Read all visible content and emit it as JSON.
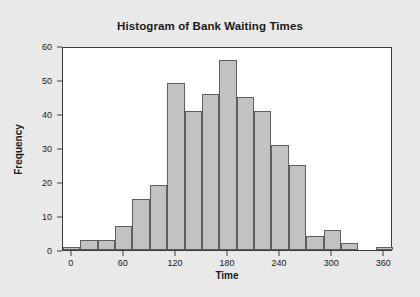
{
  "chart_data": {
    "type": "bar",
    "title": "Histogram of Bank Waiting Times",
    "xlabel": "Time",
    "ylabel": "Frequency",
    "xlim": [
      -10,
      370
    ],
    "ylim": [
      0,
      60
    ],
    "grid": false,
    "legend": null,
    "bin_width": 20,
    "xticks": [
      0,
      60,
      120,
      180,
      240,
      300,
      360
    ],
    "yticks": [
      0,
      10,
      20,
      30,
      40,
      50,
      60
    ],
    "bar_fill_color": "#c2c2c2",
    "bar_edge_color": "#5e5e5e",
    "plot_background": "#ffffff",
    "figure_background": "#e9e9e9",
    "bins": [
      {
        "start": -10,
        "end": 10,
        "value": 1
      },
      {
        "start": 10,
        "end": 30,
        "value": 3
      },
      {
        "start": 30,
        "end": 50,
        "value": 3
      },
      {
        "start": 50,
        "end": 70,
        "value": 7
      },
      {
        "start": 70,
        "end": 90,
        "value": 15
      },
      {
        "start": 90,
        "end": 110,
        "value": 19
      },
      {
        "start": 110,
        "end": 130,
        "value": 49
      },
      {
        "start": 130,
        "end": 150,
        "value": 41
      },
      {
        "start": 150,
        "end": 170,
        "value": 46
      },
      {
        "start": 170,
        "end": 190,
        "value": 56
      },
      {
        "start": 190,
        "end": 210,
        "value": 45
      },
      {
        "start": 210,
        "end": 230,
        "value": 41
      },
      {
        "start": 230,
        "end": 250,
        "value": 31
      },
      {
        "start": 250,
        "end": 270,
        "value": 25
      },
      {
        "start": 270,
        "end": 290,
        "value": 4
      },
      {
        "start": 290,
        "end": 310,
        "value": 6
      },
      {
        "start": 310,
        "end": 330,
        "value": 2
      },
      {
        "start": 330,
        "end": 350,
        "value": 0
      },
      {
        "start": 350,
        "end": 370,
        "value": 1
      }
    ],
    "categories": [
      "-10",
      "10",
      "30",
      "50",
      "70",
      "90",
      "110",
      "130",
      "150",
      "170",
      "190",
      "210",
      "230",
      "250",
      "270",
      "290",
      "310",
      "330",
      "350"
    ],
    "values": [
      1,
      3,
      3,
      7,
      15,
      19,
      49,
      41,
      46,
      56,
      45,
      41,
      31,
      25,
      4,
      6,
      2,
      0,
      1
    ]
  }
}
